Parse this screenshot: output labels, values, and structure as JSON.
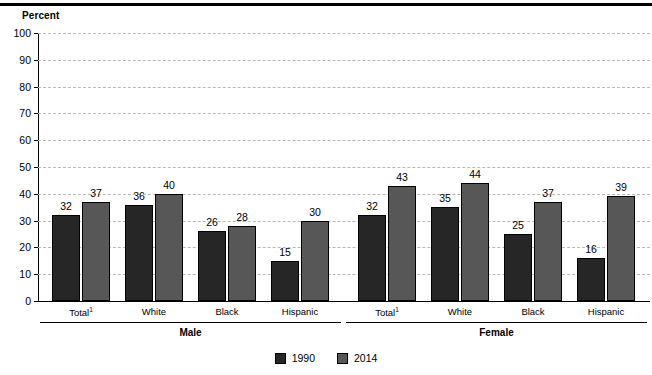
{
  "chart_data": {
    "type": "bar",
    "title": "",
    "ylabel": "Percent",
    "xlabel": "",
    "ylim": [
      0,
      100
    ],
    "yticks": [
      0,
      10,
      20,
      30,
      40,
      50,
      60,
      70,
      80,
      90,
      100
    ],
    "grid": true,
    "legend_position": "bottom-center",
    "categories": [
      "Total¹",
      "White",
      "Black",
      "Hispanic",
      "Total¹",
      "White",
      "Black",
      "Hispanic"
    ],
    "group_labels": [
      "Male",
      "Female"
    ],
    "series": [
      {
        "name": "1990",
        "color": "#262626",
        "values": [
          32,
          36,
          26,
          15,
          32,
          35,
          25,
          16
        ]
      },
      {
        "name": "2014",
        "color": "#575757",
        "values": [
          37,
          40,
          28,
          30,
          43,
          44,
          37,
          39
        ]
      }
    ],
    "groups": [
      {
        "label": "Male",
        "categories": [
          {
            "label": "Total",
            "superscript": "1",
            "values": {
              "1990": 32,
              "2014": 37
            }
          },
          {
            "label": "White",
            "superscript": "",
            "values": {
              "1990": 36,
              "2014": 40
            }
          },
          {
            "label": "Black",
            "superscript": "",
            "values": {
              "1990": 26,
              "2014": 28
            }
          },
          {
            "label": "Hispanic",
            "superscript": "",
            "values": {
              "1990": 15,
              "2014": 30
            }
          }
        ]
      },
      {
        "label": "Female",
        "categories": [
          {
            "label": "Total",
            "superscript": "1",
            "values": {
              "1990": 32,
              "2014": 43
            }
          },
          {
            "label": "White",
            "superscript": "",
            "values": {
              "1990": 35,
              "2014": 44
            }
          },
          {
            "label": "Black",
            "superscript": "",
            "values": {
              "1990": 25,
              "2014": 37
            }
          },
          {
            "label": "Hispanic",
            "superscript": "",
            "values": {
              "1990": 16,
              "2014": 39
            }
          }
        ]
      }
    ]
  },
  "legend": [
    {
      "label": "1990",
      "color": "#262626"
    },
    {
      "label": "2014",
      "color": "#575757"
    }
  ]
}
